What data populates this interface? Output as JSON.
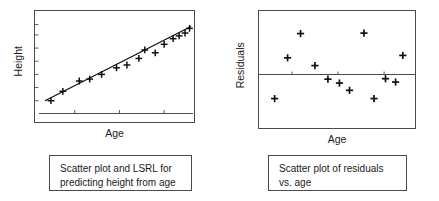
{
  "figure": {
    "title": "",
    "panels": [
      {
        "id": "left",
        "ylabel": "Height",
        "xlabel": "Age",
        "caption_line1": "Scatter plot and LSRL for",
        "caption_line2": "predicting height from age"
      },
      {
        "id": "right",
        "ylabel": "Residuals",
        "xlabel": "Age",
        "caption_line1": "Scatter plot of residuals",
        "caption_line2": "vs. age"
      }
    ]
  },
  "colors": {
    "ink": "#1a1a1a",
    "frame": "#4a4a4a",
    "marker": "#111111",
    "line": "#111111",
    "background": "#ffffff"
  },
  "chart_data": [
    {
      "type": "scatter",
      "title": "Scatter plot and LSRL for predicting height from age",
      "xlabel": "Age",
      "ylabel": "Height",
      "xlim": [
        0,
        100
      ],
      "ylim": [
        0,
        100
      ],
      "grid": false,
      "legend": null,
      "axis_tick_labels": {
        "x": [],
        "y": []
      },
      "x_ticks_positions": [
        22,
        52,
        82
      ],
      "y_ticks_positions": [
        12,
        26,
        40,
        54,
        68,
        82,
        93
      ],
      "marker": "plus",
      "points": [
        {
          "x": 6,
          "y": 12
        },
        {
          "x": 14,
          "y": 22
        },
        {
          "x": 25,
          "y": 33
        },
        {
          "x": 32,
          "y": 35
        },
        {
          "x": 40,
          "y": 40
        },
        {
          "x": 50,
          "y": 47
        },
        {
          "x": 57,
          "y": 50
        },
        {
          "x": 65,
          "y": 57
        },
        {
          "x": 69,
          "y": 66
        },
        {
          "x": 76,
          "y": 63
        },
        {
          "x": 82,
          "y": 72
        },
        {
          "x": 88,
          "y": 78
        },
        {
          "x": 92,
          "y": 81
        },
        {
          "x": 96,
          "y": 84
        },
        {
          "x": 99,
          "y": 89
        }
      ],
      "fit_line": {
        "name": "LSRL",
        "x0": 2,
        "y0": 12,
        "x1": 100,
        "y1": 91
      }
    },
    {
      "type": "scatter",
      "title": "Scatter plot of residuals vs. age",
      "xlabel": "Age",
      "ylabel": "Residuals",
      "xlim": [
        0,
        100
      ],
      "ylim": [
        -100,
        100
      ],
      "grid": false,
      "legend": null,
      "axis_tick_labels": {
        "x": [],
        "y": []
      },
      "x_ticks_positions": [
        18,
        50,
        82
      ],
      "marker": "plus",
      "zero_line": 0,
      "points": [
        {
          "x": 6,
          "y": -62
        },
        {
          "x": 15,
          "y": 22
        },
        {
          "x": 24,
          "y": 72
        },
        {
          "x": 34,
          "y": 6
        },
        {
          "x": 43,
          "y": -22
        },
        {
          "x": 51,
          "y": -30
        },
        {
          "x": 58,
          "y": -45
        },
        {
          "x": 68,
          "y": 73
        },
        {
          "x": 75,
          "y": -62
        },
        {
          "x": 83,
          "y": -21
        },
        {
          "x": 90,
          "y": -28
        },
        {
          "x": 95,
          "y": 27
        }
      ]
    }
  ]
}
